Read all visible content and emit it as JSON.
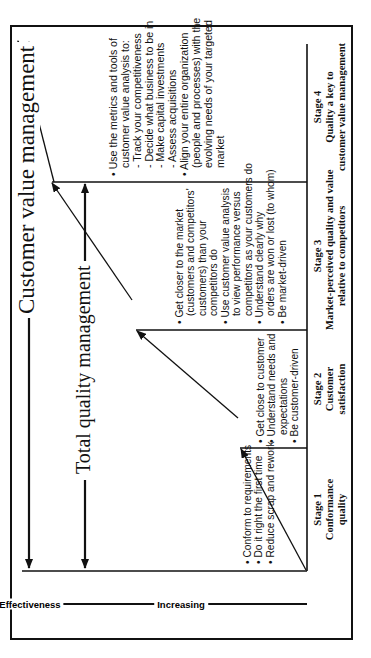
{
  "diagram": {
    "orientation": "rotated 90 degrees counterclockwise",
    "bands": {
      "customer_value_management": "Customer value management",
      "total_quality_management": "Total quality management"
    },
    "axis": {
      "increasing": "Increasing",
      "effectiveness": "Effectiveness"
    },
    "stages": [
      {
        "title": "Stage 1",
        "line1": "Conformance",
        "line2": "quality",
        "bullets": [
          "• Conform to requirements",
          "• Do it right the first time",
          "• Reduce scrap and rework"
        ]
      },
      {
        "title": "Stage 2",
        "line1": "Customer",
        "line2": "satisfaction",
        "bullets": [
          "• Get close to customer",
          "• Understand needs and",
          "   expectations",
          "• Be customer-driven"
        ]
      },
      {
        "title": "Stage 3",
        "line1": "Market-perceived quality and value",
        "line2": "relative to competitors",
        "bullets": [
          "• Get closer to the market",
          "   (customers and competitors'",
          "   customers) than your",
          "   competitors do",
          "• Use customer value analysis",
          "   to view performance versus",
          "   competitors as your customers do",
          "• Understand clearly why",
          "   orders are won or lost (to whom)",
          "• Be market-driven"
        ]
      },
      {
        "title": "Stage 4",
        "line1": "Quality a key to",
        "line2": "customer value management",
        "bullets": [
          "• Use the metrics and tools of",
          "   customer value analysis to:",
          "   - Track your competitiveness",
          "   - Decide what business to be in",
          "   - Make capital investments",
          "   - Assess acquisitions",
          "• Align your entire organization",
          "   (people and processes) with the",
          "   evolving needs of your targeted",
          "   market"
        ]
      }
    ]
  }
}
